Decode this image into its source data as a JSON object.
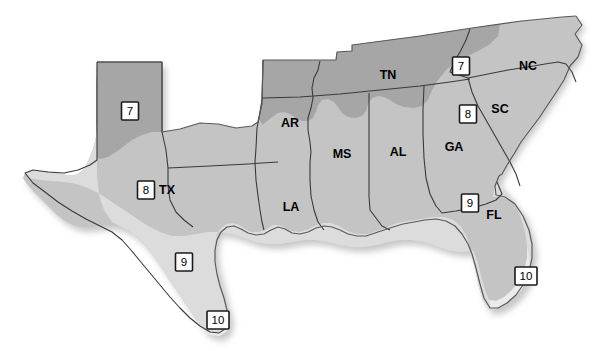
{
  "map": {
    "title": "USDA Plant Hardiness Zone Map of the Southeastern United States",
    "background_color": "#ffffff",
    "zones": [
      {
        "id": "zone-7",
        "number": "7",
        "color": "#a6a6a6"
      },
      {
        "id": "zone-8",
        "number": "8",
        "color": "#c4c4c4"
      },
      {
        "id": "zone-9",
        "number": "9",
        "color": "#dcdcdc"
      },
      {
        "id": "zone-10",
        "number": "10",
        "color": "#ebebeb"
      }
    ],
    "state_labels": [
      {
        "code": "TX",
        "x": 167,
        "y": 191
      },
      {
        "code": "LA",
        "x": 291,
        "y": 208
      },
      {
        "code": "AR",
        "x": 290,
        "y": 124
      },
      {
        "code": "MS",
        "x": 342,
        "y": 155
      },
      {
        "code": "AL",
        "x": 398,
        "y": 153
      },
      {
        "code": "TN",
        "x": 388,
        "y": 76
      },
      {
        "code": "GA",
        "x": 454,
        "y": 148
      },
      {
        "code": "SC",
        "x": 500,
        "y": 110
      },
      {
        "code": "NC",
        "x": 528,
        "y": 67
      },
      {
        "code": "FL",
        "x": 494,
        "y": 216
      }
    ],
    "zone_markers": [
      {
        "zone": "7",
        "x": 130,
        "y": 111,
        "width": 17,
        "height": 18
      },
      {
        "zone": "8",
        "x": 146,
        "y": 190,
        "width": 17,
        "height": 18
      },
      {
        "zone": "9",
        "x": 184,
        "y": 262,
        "width": 17,
        "height": 18
      },
      {
        "zone": "10",
        "x": 218,
        "y": 320,
        "width": 22,
        "height": 18
      },
      {
        "zone": "7",
        "x": 461,
        "y": 66,
        "width": 17,
        "height": 18
      },
      {
        "zone": "8",
        "x": 468,
        "y": 114,
        "width": 17,
        "height": 18
      },
      {
        "zone": "9",
        "x": 470,
        "y": 203,
        "width": 17,
        "height": 18
      },
      {
        "zone": "10",
        "x": 526,
        "y": 276,
        "width": 22,
        "height": 18
      }
    ]
  }
}
